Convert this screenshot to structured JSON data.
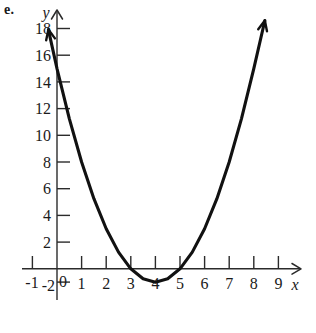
{
  "figure": {
    "label": "e.",
    "background_color": "#ffffff",
    "ink_color": "#111111"
  },
  "chart_data": {
    "type": "line",
    "title": "",
    "subtitle": "",
    "xlabel": "x",
    "ylabel": "y",
    "grid": false,
    "legend": null,
    "annotations": [],
    "function": "y = x^2 - 8x + 15",
    "vertex": [
      4,
      -1
    ],
    "x_intercepts": [
      3,
      5
    ],
    "y_intercept": 15,
    "xlim": [
      -1.5,
      9.6
    ],
    "ylim": [
      -2.6,
      19.2
    ],
    "xticks": [
      -1,
      0,
      1,
      2,
      3,
      4,
      5,
      6,
      7,
      8,
      9
    ],
    "yticks": [
      -2,
      0,
      2,
      4,
      6,
      8,
      10,
      12,
      14,
      16,
      18
    ],
    "xtick_labels": [
      "-1",
      "0",
      "1",
      "2",
      "3",
      "4",
      "5",
      "6",
      "7",
      "8",
      "9"
    ],
    "ytick_labels": [
      "-2",
      "0",
      "2",
      "4",
      "6",
      "8",
      "10",
      "12",
      "14",
      "16",
      "18"
    ],
    "curve_endpoints": {
      "left": {
        "x": -0.35,
        "y": 17.9,
        "arrow": true
      },
      "right": {
        "x": 8.45,
        "y": 18.6,
        "arrow": true
      }
    },
    "x": [
      -0.35,
      0,
      0.5,
      1,
      1.5,
      2,
      2.5,
      3,
      3.5,
      4,
      4.5,
      5,
      5.5,
      6,
      6.5,
      7,
      7.5,
      8,
      8.45
    ],
    "y": [
      17.92,
      15,
      11.25,
      8,
      5.25,
      3,
      1.25,
      0,
      -0.75,
      -1,
      -0.75,
      0,
      1.25,
      3,
      5.25,
      8,
      11.25,
      15,
      18.6
    ]
  },
  "axes": {
    "y_axis": {
      "name": "y",
      "label_text": "y",
      "arrow_at_top": true,
      "tick_side": "right"
    },
    "x_axis": {
      "name": "x",
      "label_text": "x",
      "arrow_at_right": true,
      "tick_side": "above"
    },
    "origin_label": "0"
  },
  "ytick_text": {
    "t18": "18",
    "t16": "16",
    "t14": "14",
    "t12": "12",
    "t10": "10",
    "t8": "8",
    "t6": "6",
    "t4": "4",
    "t2": "2",
    "tm2": "-2"
  },
  "xtick_text": {
    "tm1": "-1",
    "t0": "0",
    "t1": "1",
    "t2": "2",
    "t3": "3",
    "t4": "4",
    "t5": "5",
    "t6": "6",
    "t7": "7",
    "t8": "8",
    "t9": "9"
  }
}
